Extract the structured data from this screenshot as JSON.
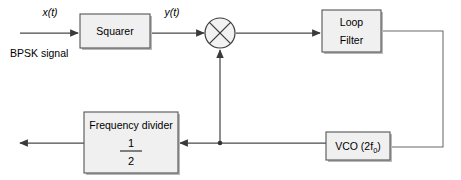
{
  "diagram": {
    "background_color": "#ffffff",
    "line_color": "#4a4a4a",
    "block_fill": "#f0f0f0",
    "block_stroke": "#555555",
    "input": {
      "signal_label": "x(t)",
      "caption": "BPSK signal"
    },
    "intermediate": {
      "signal_label": "y(t)"
    },
    "blocks": {
      "squarer": {
        "label": "Squarer"
      },
      "mixer": {
        "label": "multiplier"
      },
      "loop_filter": {
        "line1": "Loop",
        "line2": "Filter"
      },
      "vco": {
        "label": "VCO (2f",
        "subscript": "0",
        "label_end": ")"
      },
      "frequency_divider": {
        "title": "Frequency divider",
        "numerator": "1",
        "denominator": "2"
      }
    }
  }
}
